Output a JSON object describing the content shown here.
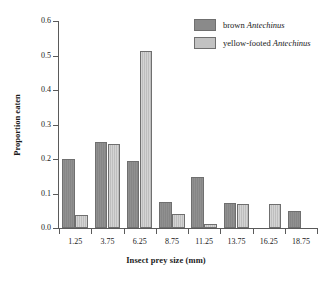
{
  "chart_data": {
    "type": "bar",
    "title": "",
    "xlabel": "Insect prey size (mm)",
    "ylabel": "Proportion eaten",
    "categories": [
      "1.25",
      "3.75",
      "6.25",
      "8.75",
      "11.25",
      "13.75",
      "16.25",
      "18.75"
    ],
    "ylim": [
      0.0,
      0.6
    ],
    "yticks": [
      "0.0",
      "0.1",
      "0.2",
      "0.3",
      "0.4",
      "0.5",
      "0.6"
    ],
    "ytick_values": [
      0.0,
      0.1,
      0.2,
      0.3,
      0.4,
      0.5,
      0.6
    ],
    "grid": false,
    "legend_position": "top-right",
    "series": [
      {
        "name": "brown Antechinus",
        "name_prefix": "brown ",
        "name_species": "Antechinus",
        "color": "#8a8a8a",
        "values": [
          0.201,
          0.249,
          0.193,
          0.075,
          0.147,
          0.073,
          0.0,
          0.05
        ]
      },
      {
        "name": "yellow-footed Antechinus",
        "name_prefix": "yellow-footed ",
        "name_species": "Antechinus",
        "color": "#c2c2c2",
        "values": [
          0.038,
          0.244,
          0.513,
          0.04,
          0.012,
          0.069,
          0.071,
          0.0
        ]
      }
    ]
  },
  "axis": {
    "y_title": "Proportion eaten",
    "x_title": "Insect prey size (mm)"
  },
  "legend": {
    "items": [
      {
        "prefix": "brown ",
        "species": "Antechinus",
        "color": "#8a8a8a"
      },
      {
        "prefix": "yellow-footed ",
        "species": "Antechinus",
        "color": "#c2c2c2"
      }
    ]
  },
  "colors": {
    "axis": "#5a5a5a",
    "bar_outline": "#6f6f6f",
    "background": "#ffffff",
    "text": "#1a1a1a"
  }
}
